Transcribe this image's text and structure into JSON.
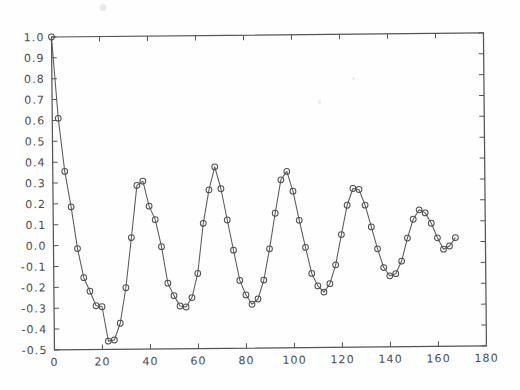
{
  "figure": {
    "title": "",
    "background_color": "#fefefe",
    "ink_color": "#555555"
  },
  "axes": {
    "x_ticks": [
      "0",
      "20",
      "40",
      "60",
      "80",
      "100",
      "120",
      "140",
      "160",
      "180"
    ],
    "y_ticks": [
      "1.0",
      "0.9",
      "0.8",
      "0.7",
      "0.6",
      "0.5",
      "0.4",
      "0.3",
      "0.2",
      "0.1",
      "0.0",
      "-0.1",
      "-0.2",
      "-0.3",
      "-0.4",
      "-0.5"
    ]
  },
  "chart_data": {
    "type": "line",
    "title": "",
    "xlabel": "",
    "ylabel": "",
    "xlim": [
      0,
      180
    ],
    "ylim": [
      -0.5,
      1.0
    ],
    "xticks": [
      0,
      20,
      40,
      60,
      80,
      100,
      120,
      140,
      160,
      180
    ],
    "yticks": [
      -0.5,
      -0.4,
      -0.3,
      -0.2,
      -0.1,
      0.0,
      0.1,
      0.2,
      0.3,
      0.4,
      0.5,
      0.6,
      0.7,
      0.8,
      0.9,
      1.0
    ],
    "grid": false,
    "legend": null,
    "marker": "circle-open",
    "line_style": "solid",
    "series": [
      {
        "name": "damped oscillation",
        "x": [
          0,
          2.5,
          5,
          7.5,
          10,
          12.5,
          15,
          17.5,
          20,
          22.5,
          25,
          27.5,
          30,
          32.5,
          35,
          37.5,
          40,
          42.5,
          45,
          47.5,
          50,
          52.5,
          55,
          57.5,
          60,
          62.5,
          65,
          67.5,
          70,
          72.5,
          75,
          77.5,
          80,
          82.5,
          85,
          87.5,
          90,
          92.5,
          95,
          97.5,
          100,
          102.5,
          105,
          107.5,
          110,
          112.5,
          115,
          117.5,
          120,
          122.5,
          125,
          127.5,
          130,
          132.5,
          135,
          137.5,
          140,
          142.5,
          145,
          147.5,
          150,
          152.5,
          155,
          157.5,
          160,
          162.5,
          165,
          167.5
        ],
        "y": [
          1.0,
          0.61,
          0.355,
          0.185,
          -0.015,
          -0.155,
          -0.22,
          -0.29,
          -0.295,
          -0.46,
          -0.455,
          -0.375,
          -0.205,
          0.035,
          0.285,
          0.305,
          0.185,
          0.12,
          -0.01,
          -0.185,
          -0.245,
          -0.295,
          -0.3,
          -0.255,
          -0.14,
          0.1,
          0.26,
          0.37,
          0.265,
          0.115,
          -0.03,
          -0.175,
          -0.245,
          -0.29,
          -0.265,
          -0.175,
          -0.025,
          0.145,
          0.305,
          0.345,
          0.25,
          0.11,
          -0.02,
          -0.145,
          -0.205,
          -0.235,
          -0.195,
          -0.105,
          0.04,
          0.18,
          0.26,
          0.255,
          0.18,
          0.075,
          -0.03,
          -0.12,
          -0.16,
          -0.15,
          -0.09,
          0.02,
          0.11,
          0.155,
          0.14,
          0.09,
          0.02,
          -0.035,
          -0.02,
          0.02
        ]
      }
    ]
  }
}
